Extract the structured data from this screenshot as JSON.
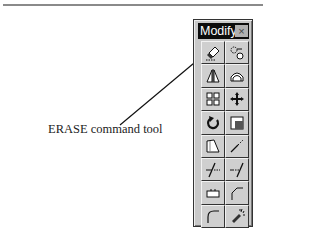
{
  "figure": {
    "caption": "ERASE command tool"
  },
  "toolbar": {
    "title": "Modify",
    "close_glyph": "×",
    "tools": [
      {
        "name": "erase",
        "icon": "eraser-icon"
      },
      {
        "name": "copy",
        "icon": "copy-object-icon"
      },
      {
        "name": "mirror",
        "icon": "mirror-icon"
      },
      {
        "name": "offset",
        "icon": "offset-icon"
      },
      {
        "name": "array",
        "icon": "array-icon"
      },
      {
        "name": "move",
        "icon": "move-icon"
      },
      {
        "name": "rotate",
        "icon": "rotate-icon"
      },
      {
        "name": "scale",
        "icon": "scale-icon"
      },
      {
        "name": "stretch",
        "icon": "stretch-icon"
      },
      {
        "name": "lengthen",
        "icon": "lengthen-icon"
      },
      {
        "name": "trim",
        "icon": "trim-icon"
      },
      {
        "name": "extend",
        "icon": "extend-icon"
      },
      {
        "name": "break",
        "icon": "break-icon"
      },
      {
        "name": "chamfer",
        "icon": "chamfer-icon"
      },
      {
        "name": "fillet",
        "icon": "fillet-icon"
      },
      {
        "name": "explode",
        "icon": "explode-icon"
      }
    ]
  }
}
